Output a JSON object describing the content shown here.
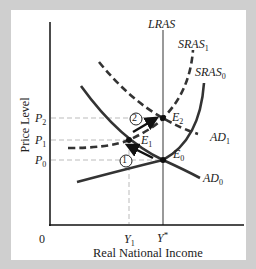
{
  "diagram": {
    "title": "",
    "y_axis_label": "Price Level",
    "x_axis_label": "Real National Income",
    "origin_label": "0",
    "price_levels": [
      {
        "id": "P2",
        "base": "P",
        "sub": "2"
      },
      {
        "id": "P1",
        "base": "P",
        "sub": "1"
      },
      {
        "id": "P0",
        "base": "P",
        "sub": "0"
      }
    ],
    "income_levels": [
      {
        "id": "Y1",
        "base": "Y",
        "sub": "1"
      },
      {
        "id": "Ystar",
        "base": "Y",
        "sup": "*"
      }
    ],
    "curves": {
      "lras": {
        "label": "LRAS",
        "style": "solid-gray"
      },
      "sras1": {
        "base": "SRAS",
        "sub": "1",
        "style": "dashed"
      },
      "sras0": {
        "base": "SRAS",
        "sub": "0",
        "style": "solid"
      },
      "ad1": {
        "base": "AD",
        "sub": "1",
        "style": "dashed"
      },
      "ad0": {
        "base": "AD",
        "sub": "0",
        "style": "solid"
      }
    },
    "equilibria": [
      {
        "base": "E",
        "sub": "0"
      },
      {
        "base": "E",
        "sub": "1"
      },
      {
        "base": "E",
        "sub": "2"
      }
    ],
    "steps": [
      {
        "label": "1",
        "description": "move from E0 to E1"
      },
      {
        "label": "2",
        "description": "move from E1 to E2"
      }
    ],
    "colors": {
      "background": "#cfcfcf",
      "panel": "#ffffff",
      "curve": "#333333",
      "lras": "#999999",
      "guide": "#bbbbbb"
    }
  }
}
